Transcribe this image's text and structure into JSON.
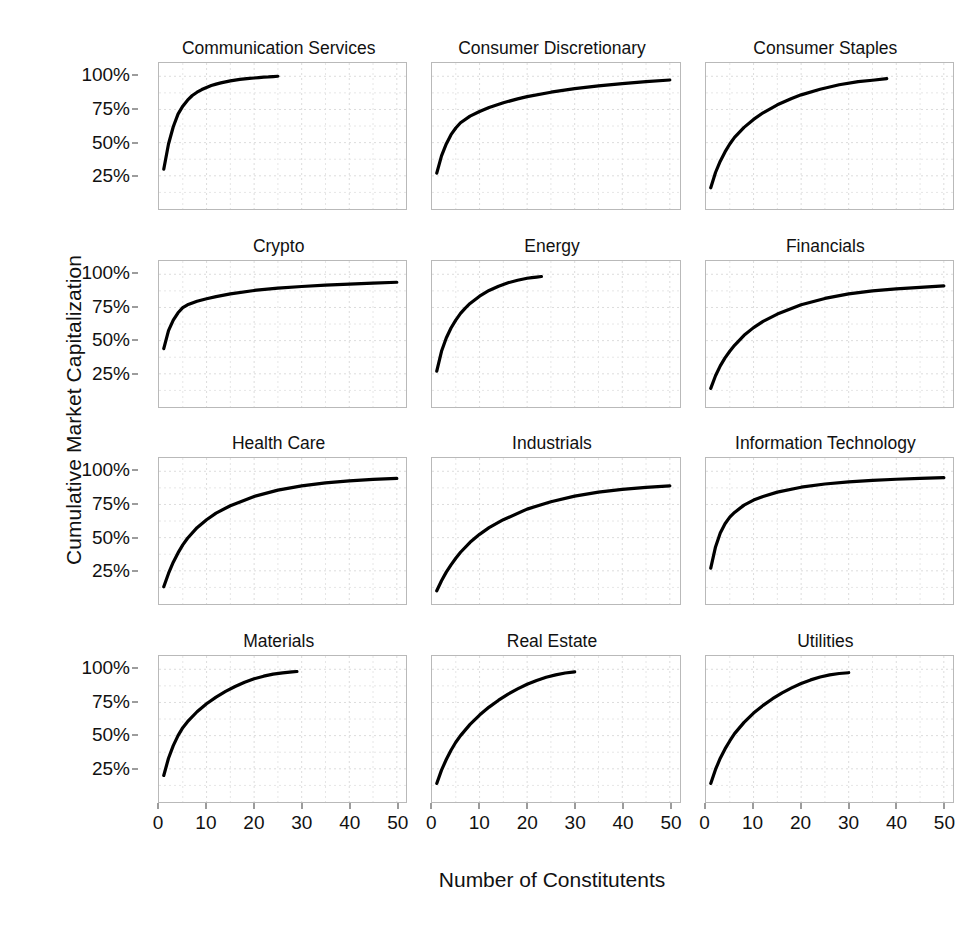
{
  "chart_data": {
    "type": "line",
    "title": "",
    "xlabel": "Number of Constitutents",
    "ylabel": "Cumulative Market Capitalization",
    "xlim": [
      0,
      52
    ],
    "ylim": [
      0,
      110
    ],
    "grid": true,
    "legend": "none",
    "layout": {
      "rows": 4,
      "cols": 3,
      "facet": "sector"
    },
    "x_ticks": [
      0,
      10,
      20,
      30,
      40,
      50
    ],
    "x_tick_labels": [
      "0",
      "10",
      "20",
      "30",
      "40",
      "50"
    ],
    "y_ticks": [
      25,
      50,
      75,
      100
    ],
    "y_tick_labels": [
      "25%",
      "50%",
      "75%",
      "100%"
    ],
    "line_color": "#000000",
    "panels": [
      {
        "title": "Communication Services",
        "x": [
          1,
          2,
          3,
          4,
          5,
          6,
          7,
          8,
          9,
          10,
          11,
          12,
          13,
          14,
          15,
          16,
          17,
          18,
          19,
          20,
          21,
          22,
          23,
          24,
          25
        ],
        "y": [
          30.0,
          49.0,
          62.0,
          71.5,
          77.5,
          82.0,
          85.5,
          88.0,
          90.0,
          91.6,
          93.0,
          94.1,
          95.0,
          95.8,
          96.5,
          97.1,
          97.6,
          98.0,
          98.4,
          98.7,
          99.0,
          99.3,
          99.5,
          99.8,
          100.0
        ]
      },
      {
        "title": "Consumer Discretionary",
        "x": [
          1,
          2,
          3,
          4,
          5,
          6,
          8,
          10,
          12,
          15,
          18,
          20,
          25,
          30,
          35,
          40,
          45,
          50
        ],
        "y": [
          27.0,
          40.0,
          49.0,
          56.0,
          61.0,
          65.0,
          70.0,
          73.5,
          76.5,
          80.0,
          83.0,
          84.7,
          88.0,
          90.7,
          92.8,
          94.5,
          96.0,
          97.2
        ]
      },
      {
        "title": "Consumer Staples",
        "x": [
          1,
          2,
          3,
          4,
          5,
          6,
          8,
          10,
          12,
          15,
          18,
          20,
          24,
          28,
          32,
          35,
          38
        ],
        "y": [
          16.0,
          27.5,
          36.0,
          43.0,
          49.0,
          54.0,
          61.5,
          67.5,
          72.5,
          78.5,
          83.3,
          86.0,
          90.2,
          93.6,
          96.0,
          97.0,
          98.2
        ]
      },
      {
        "title": "Crypto",
        "x": [
          1,
          2,
          3,
          4,
          5,
          6,
          8,
          10,
          12,
          15,
          20,
          25,
          30,
          35,
          40,
          45,
          50
        ],
        "y": [
          44.0,
          57.5,
          65.5,
          71.0,
          74.8,
          77.0,
          79.7,
          81.6,
          83.2,
          85.2,
          87.8,
          89.5,
          90.8,
          91.8,
          92.6,
          93.3,
          94.0
        ]
      },
      {
        "title": "Energy",
        "x": [
          1,
          2,
          3,
          4,
          5,
          6,
          7,
          8,
          10,
          12,
          14,
          16,
          18,
          20,
          21,
          22,
          23
        ],
        "y": [
          27.0,
          42.0,
          52.0,
          59.5,
          65.5,
          70.5,
          74.5,
          78.0,
          83.5,
          87.8,
          91.0,
          93.6,
          95.5,
          97.0,
          97.5,
          97.9,
          98.3
        ]
      },
      {
        "title": "Financials",
        "x": [
          1,
          2,
          3,
          4,
          5,
          6,
          8,
          10,
          12,
          15,
          20,
          25,
          30,
          35,
          40,
          45,
          50
        ],
        "y": [
          14.0,
          23.5,
          31.0,
          37.0,
          42.0,
          46.5,
          54.0,
          59.8,
          64.5,
          70.0,
          77.0,
          81.8,
          85.2,
          87.5,
          89.0,
          90.2,
          91.2
        ]
      },
      {
        "title": "Health Care",
        "x": [
          1,
          2,
          3,
          4,
          5,
          6,
          8,
          10,
          12,
          15,
          20,
          25,
          30,
          35,
          40,
          45,
          50
        ],
        "y": [
          13.0,
          23.0,
          31.5,
          38.5,
          44.5,
          49.5,
          57.5,
          63.5,
          68.5,
          74.0,
          81.0,
          85.8,
          89.0,
          91.3,
          92.8,
          93.9,
          94.6
        ]
      },
      {
        "title": "Industrials",
        "x": [
          1,
          2,
          3,
          4,
          5,
          6,
          8,
          10,
          12,
          15,
          20,
          25,
          30,
          35,
          40,
          45,
          50
        ],
        "y": [
          10.0,
          17.5,
          24.0,
          29.5,
          34.5,
          39.0,
          46.5,
          52.5,
          57.5,
          63.5,
          71.5,
          77.0,
          81.3,
          84.3,
          86.4,
          87.9,
          89.0
        ]
      },
      {
        "title": "Information Technology",
        "x": [
          1,
          2,
          3,
          4,
          5,
          6,
          8,
          10,
          12,
          15,
          20,
          25,
          30,
          35,
          40,
          45,
          50
        ],
        "y": [
          27.0,
          43.0,
          53.5,
          60.5,
          65.5,
          69.0,
          74.5,
          78.3,
          81.0,
          84.3,
          88.0,
          90.4,
          92.0,
          93.2,
          94.0,
          94.6,
          95.2
        ]
      },
      {
        "title": "Materials",
        "x": [
          1,
          2,
          3,
          4,
          5,
          6,
          8,
          10,
          12,
          14,
          16,
          18,
          20,
          22,
          24,
          26,
          28,
          29
        ],
        "y": [
          20.0,
          33.0,
          42.5,
          50.0,
          56.0,
          60.5,
          68.0,
          74.0,
          79.0,
          83.3,
          87.0,
          90.2,
          92.8,
          94.8,
          96.3,
          97.3,
          98.0,
          98.3
        ]
      },
      {
        "title": "Real Estate",
        "x": [
          1,
          2,
          3,
          4,
          5,
          6,
          8,
          10,
          12,
          14,
          16,
          18,
          20,
          22,
          24,
          26,
          28,
          30
        ],
        "y": [
          14.0,
          24.0,
          32.0,
          39.0,
          45.0,
          50.0,
          58.5,
          65.5,
          71.5,
          76.7,
          81.3,
          85.2,
          88.7,
          91.6,
          94.0,
          95.8,
          97.2,
          98.0
        ]
      },
      {
        "title": "Utilities",
        "x": [
          1,
          2,
          3,
          4,
          5,
          6,
          8,
          10,
          12,
          14,
          16,
          18,
          20,
          22,
          24,
          26,
          28,
          30
        ],
        "y": [
          14.0,
          24.5,
          33.0,
          40.0,
          46.0,
          51.5,
          60.0,
          67.0,
          72.8,
          77.8,
          82.2,
          86.0,
          89.3,
          92.0,
          94.2,
          95.8,
          96.8,
          97.4
        ]
      }
    ]
  }
}
